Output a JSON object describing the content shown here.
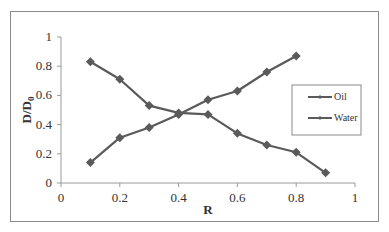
{
  "chart_data": {
    "type": "line",
    "title": "",
    "xlabel": "R",
    "ylabel": "D/D0",
    "ylabel_main": "D/D",
    "ylabel_sub": "0",
    "xlim": [
      0,
      1
    ],
    "ylim": [
      0,
      1
    ],
    "x_ticks": [
      0,
      0.2,
      0.4,
      0.6,
      0.8,
      1
    ],
    "x_tick_labels": [
      "0",
      "0.2",
      "0.4",
      "0.6",
      "0.8",
      "1"
    ],
    "y_ticks": [
      0,
      0.2,
      0.4,
      0.6,
      0.8,
      1
    ],
    "y_tick_labels": [
      "0",
      "0.2",
      "0.4",
      "0.6",
      "0.8",
      "1"
    ],
    "grid": false,
    "legend_position": "right",
    "series": [
      {
        "name": "Oil",
        "color": "#5a5a5a",
        "marker": "diamond",
        "x": [
          0.1,
          0.2,
          0.3,
          0.4,
          0.5,
          0.6,
          0.7,
          0.8
        ],
        "values": [
          0.14,
          0.31,
          0.38,
          0.47,
          0.57,
          0.63,
          0.76,
          0.87
        ]
      },
      {
        "name": "Water",
        "color": "#5a5a5a",
        "marker": "diamond",
        "x": [
          0.1,
          0.2,
          0.3,
          0.4,
          0.5,
          0.6,
          0.7,
          0.8,
          0.9
        ],
        "values": [
          0.83,
          0.71,
          0.53,
          0.48,
          0.47,
          0.34,
          0.26,
          0.21,
          0.07
        ]
      }
    ]
  },
  "legend": {
    "items": [
      {
        "label": "Oil"
      },
      {
        "label": "Water"
      }
    ]
  }
}
